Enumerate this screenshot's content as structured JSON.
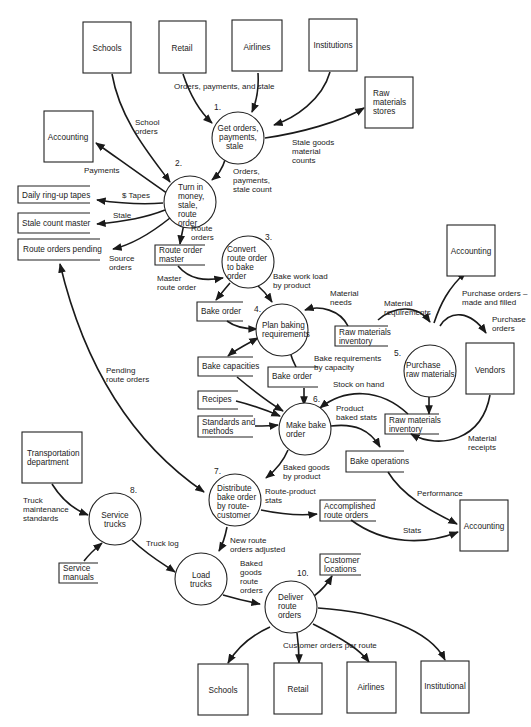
{
  "diagram": {
    "type": "data-flow-diagram",
    "external_entities": [
      {
        "id": "schools_top",
        "label": "Schools"
      },
      {
        "id": "retail_top",
        "label": "Retail"
      },
      {
        "id": "airlines_top",
        "label": "Airlines"
      },
      {
        "id": "institutions_top",
        "label": "Institutions"
      },
      {
        "id": "raw_materials_stores",
        "label": [
          "Raw",
          "materials",
          "stores"
        ]
      },
      {
        "id": "accounting_left",
        "label": "Accounting"
      },
      {
        "id": "accounting_right_top",
        "label": "Accounting"
      },
      {
        "id": "vendors",
        "label": "Vendors"
      },
      {
        "id": "transportation_department",
        "label": [
          "Transportation",
          "department"
        ]
      },
      {
        "id": "accounting_right_bottom",
        "label": "Accounting"
      },
      {
        "id": "schools_bottom",
        "label": "Schools"
      },
      {
        "id": "retail_bottom",
        "label": "Retail"
      },
      {
        "id": "airlines_bottom",
        "label": "Airlines"
      },
      {
        "id": "institutional_bottom",
        "label": "Institutional"
      }
    ],
    "processes": [
      {
        "num": "1.",
        "label": [
          "Get orders,",
          "payments,",
          "stale"
        ]
      },
      {
        "num": "2.",
        "label": [
          "Turn in",
          "money,",
          "stale,",
          "route",
          "order"
        ]
      },
      {
        "num": "3.",
        "label": [
          "Convert",
          "route order",
          "to bake",
          "order"
        ]
      },
      {
        "num": "4.",
        "label": [
          "Plan baking",
          "requirements"
        ]
      },
      {
        "num": "5.",
        "label": [
          "Purchase",
          "raw materials"
        ]
      },
      {
        "num": "6.",
        "label": [
          "Make bake",
          "order"
        ]
      },
      {
        "num": "7.",
        "label": [
          "Distribute",
          "bake order",
          "by route-",
          "customer"
        ]
      },
      {
        "num": "8.",
        "label": [
          "Service",
          "trucks"
        ]
      },
      {
        "num": "",
        "label": [
          "Load",
          "trucks"
        ]
      },
      {
        "num": "10.",
        "label": [
          "Deliver",
          "route",
          "orders"
        ]
      }
    ],
    "data_stores": [
      {
        "id": "daily_ringup",
        "label": [
          "Daily ring-up tapes"
        ]
      },
      {
        "id": "stale_count_master",
        "label": [
          "Stale count master"
        ]
      },
      {
        "id": "route_orders_pending",
        "label": [
          "Route orders pending"
        ]
      },
      {
        "id": "route_order_master",
        "label": [
          "Route order",
          "master"
        ]
      },
      {
        "id": "bake_order_1",
        "label": [
          "Bake order"
        ]
      },
      {
        "id": "raw_materials_inventory_1",
        "label": [
          "Raw materials",
          "inventory"
        ]
      },
      {
        "id": "bake_capacities",
        "label": [
          "Bake capacities"
        ]
      },
      {
        "id": "bake_order_2",
        "label": [
          "Bake order"
        ]
      },
      {
        "id": "recipes",
        "label": [
          "Recipes"
        ]
      },
      {
        "id": "standards_methods",
        "label": [
          "Standards and",
          "methods"
        ]
      },
      {
        "id": "raw_materials_inventory_2",
        "label": [
          "Raw materials",
          "inventory"
        ]
      },
      {
        "id": "bake_operations",
        "label": [
          "Bake operations"
        ]
      },
      {
        "id": "accomplished_route_orders",
        "label": [
          "Accomplished",
          "route orders"
        ]
      },
      {
        "id": "customer_locations",
        "label": [
          "Customer",
          "locations"
        ]
      },
      {
        "id": "service_manuals",
        "label": [
          "Service",
          "manuals"
        ]
      }
    ],
    "flows": [
      {
        "label": [
          "Orders, payments, and stale"
        ]
      },
      {
        "label": [
          "School",
          "orders"
        ]
      },
      {
        "label": [
          "Stale goods",
          "material",
          "counts"
        ]
      },
      {
        "label": [
          "Payments"
        ]
      },
      {
        "label": [
          "Orders,",
          "payments,",
          "stale count"
        ]
      },
      {
        "label": [
          "$ Tapes"
        ]
      },
      {
        "label": [
          "Stale"
        ]
      },
      {
        "label": [
          "Route",
          "orders"
        ]
      },
      {
        "label": [
          "Source",
          "orders"
        ]
      },
      {
        "label": [
          "Master",
          "route order"
        ]
      },
      {
        "label": [
          "Bake work load",
          "by product"
        ]
      },
      {
        "label": [
          "Material",
          "needs"
        ]
      },
      {
        "label": [
          "Material",
          "requirements"
        ]
      },
      {
        "label": [
          "Purchase orders –",
          "made and filled"
        ]
      },
      {
        "label": [
          "Purchase",
          "orders"
        ]
      },
      {
        "label": [
          "Pending",
          "route orders"
        ]
      },
      {
        "label": [
          "Bake requirements",
          "by capacity"
        ]
      },
      {
        "label": [
          "Stock on hand"
        ]
      },
      {
        "label": [
          "Product",
          "baked stats"
        ]
      },
      {
        "label": [
          "Material",
          "receipts"
        ]
      },
      {
        "label": [
          "Baked goods",
          "by product"
        ]
      },
      {
        "label": [
          "Route-product",
          "stats"
        ]
      },
      {
        "label": [
          "Performance"
        ]
      },
      {
        "label": [
          "Stats"
        ]
      },
      {
        "label": [
          "Truck",
          "maintenance",
          "standards"
        ]
      },
      {
        "label": [
          "Truck log"
        ]
      },
      {
        "label": [
          "New route",
          "orders adjusted"
        ]
      },
      {
        "label": [
          "Baked",
          "goods",
          "route",
          "orders"
        ]
      },
      {
        "label": [
          "Customer orders per route"
        ]
      }
    ]
  }
}
